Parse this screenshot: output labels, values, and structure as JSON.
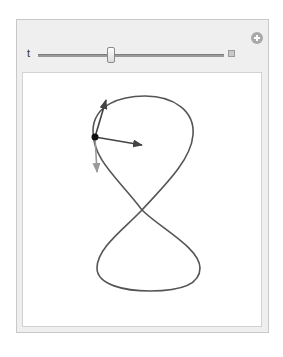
{
  "manipulate": {
    "header_title": "",
    "control": {
      "variable_label": "t",
      "slider_position_fraction": 0.39,
      "expand_button": "options-toggle"
    },
    "corner_button": "add-bookmark"
  },
  "graphic": {
    "curve": "figure-eight (lemniscate-like)",
    "colors": {
      "curve": "#555555",
      "point": "#111111",
      "tangent_arrow": "#444444",
      "normal_arrow": "#444444",
      "acceleration_arrow": "#999999"
    },
    "point": {
      "x": 95,
      "y": 137
    },
    "arrows": [
      {
        "name": "tangent",
        "to": {
          "x": 106,
          "y": 100
        }
      },
      {
        "name": "normal",
        "to": {
          "x": 142,
          "y": 145
        }
      },
      {
        "name": "gray-vector",
        "to": {
          "x": 97,
          "y": 172
        }
      }
    ]
  }
}
